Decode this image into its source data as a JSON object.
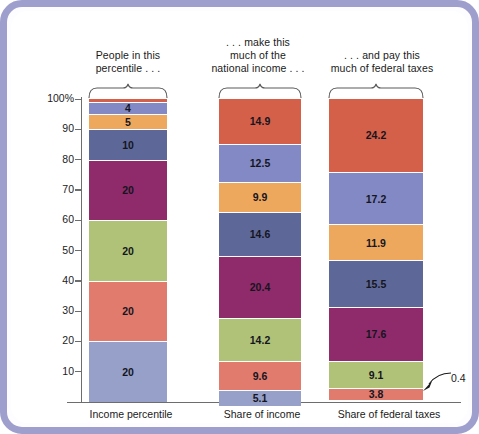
{
  "figure": {
    "frame_color": "#9f9fcd",
    "background": "#ffffff"
  },
  "headers": [
    {
      "id": "people",
      "lines": [
        "People in this",
        "percentile . . ."
      ]
    },
    {
      "id": "income",
      "lines": [
        ". . . make this",
        "much of the",
        "national income . . ."
      ]
    },
    {
      "id": "taxes",
      "lines": [
        ". . . and pay this",
        "much of federal taxes"
      ]
    }
  ],
  "callout": {
    "label": "0.4",
    "icon": "leader-arrow-icon"
  },
  "chart_data": {
    "type": "bar",
    "subtype": "100% stacked column",
    "title": "",
    "xlabel": "",
    "ylabel": "",
    "ylim": [
      0,
      100
    ],
    "yticks": [
      "100%",
      "90",
      "80",
      "70",
      "60",
      "50",
      "40",
      "30",
      "20",
      "10"
    ],
    "ytick_values": [
      100,
      90,
      80,
      70,
      60,
      50,
      40,
      30,
      20,
      10
    ],
    "grid": false,
    "legend": "none",
    "categories": [
      "Income percentile",
      "Share of income",
      "Share of federal taxes"
    ],
    "stack_order": "top-to-bottom = highest income group first",
    "series": [
      {
        "name": "Top 1 percent",
        "color": "#d4604a",
        "values": [
          1,
          14.9,
          24.2
        ],
        "labels": [
          "1",
          "14.9",
          "24.2"
        ]
      },
      {
        "name": "Next 4 percent",
        "color": "#8289c4",
        "values": [
          4,
          12.5,
          17.2
        ],
        "labels": [
          "4",
          "12.5",
          "17.2"
        ]
      },
      {
        "name": "Next 5 percent",
        "color": "#eda85e",
        "values": [
          5,
          9.9,
          11.9
        ],
        "labels": [
          "5",
          "9.9",
          "11.9"
        ]
      },
      {
        "name": "Next 10 percent",
        "color": "#5e6898",
        "values": [
          10,
          14.6,
          15.5
        ],
        "labels": [
          "10",
          "14.6",
          "15.5"
        ]
      },
      {
        "name": "Fourth quintile",
        "color": "#8f2b6b",
        "values": [
          20,
          20.4,
          17.6
        ],
        "labels": [
          "20",
          "20.4",
          "17.6"
        ]
      },
      {
        "name": "Third quintile",
        "color": "#afc278",
        "values": [
          20,
          14.2,
          9.1
        ],
        "labels": [
          "20",
          "14.2",
          "9.1"
        ]
      },
      {
        "name": "Second quintile",
        "color": "#e07b6e",
        "values": [
          20,
          9.6,
          3.8
        ],
        "labels": [
          "20",
          "9.6",
          "3.8"
        ]
      },
      {
        "name": "Lowest quintile",
        "color": "#96a0c8",
        "values": [
          20,
          5.1,
          0.4
        ],
        "labels": [
          "20",
          "5.1",
          "0.4"
        ]
      }
    ],
    "annotations": [
      {
        "text": "0.4",
        "target": "Share of federal taxes / lowest quintile"
      }
    ]
  }
}
